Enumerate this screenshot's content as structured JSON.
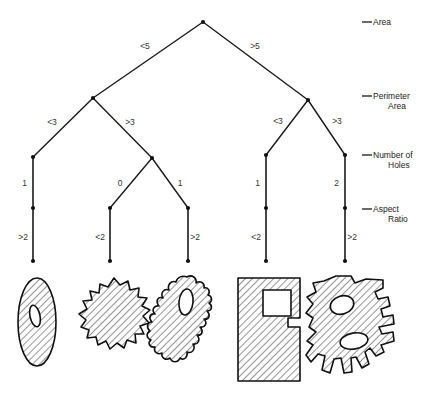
{
  "figure": {
    "type": "decision-tree-diagram",
    "background_color": "#ffffff",
    "line_color": "#111111",
    "text_color": "#333333"
  },
  "legend": {
    "items": [
      {
        "id": "area",
        "label": "Area",
        "label_lines": [
          "Area"
        ],
        "y": 22
      },
      {
        "id": "perimeter-area",
        "label": "Perimeter Area",
        "label_lines": [
          "Perimeter",
          "Area"
        ],
        "y": 96
      },
      {
        "id": "number-of-holes",
        "label": "Number of Holes",
        "label_lines": [
          "Number of",
          "Holes"
        ],
        "y": 155
      },
      {
        "id": "aspect-ratio",
        "label": "Aspect Ratio",
        "label_lines": [
          "Aspect",
          "Ratio"
        ],
        "y": 209
      }
    ]
  },
  "tree": {
    "levels": [
      "Area",
      "Perimeter Area",
      "Number of Holes",
      "Aspect Ratio"
    ],
    "nodes": [
      {
        "id": "root",
        "x": 203,
        "y": 22,
        "level": "Area"
      },
      {
        "id": "n-left",
        "x": 93,
        "y": 98,
        "level": "Perimeter Area"
      },
      {
        "id": "n-right",
        "x": 308,
        "y": 100,
        "level": "Perimeter Area"
      },
      {
        "id": "n-ll",
        "x": 33,
        "y": 157,
        "level": "Number of Holes"
      },
      {
        "id": "n-lr",
        "x": 152,
        "y": 158,
        "level": "Number of Holes"
      },
      {
        "id": "n-rl",
        "x": 266,
        "y": 155,
        "level": "Number of Holes"
      },
      {
        "id": "n-rr",
        "x": 345,
        "y": 155,
        "level": "Number of Holes"
      },
      {
        "id": "n-ll-a",
        "x": 33,
        "y": 208,
        "level": "Aspect Ratio"
      },
      {
        "id": "n-lr-a",
        "x": 110,
        "y": 208,
        "level": "Aspect Ratio"
      },
      {
        "id": "n-lr-b",
        "x": 188,
        "y": 208,
        "level": "Aspect Ratio"
      },
      {
        "id": "n-rl-a",
        "x": 266,
        "y": 208,
        "level": "Aspect Ratio"
      },
      {
        "id": "n-rr-a",
        "x": 345,
        "y": 208,
        "level": "Aspect Ratio"
      },
      {
        "id": "leaf-1",
        "x": 33,
        "y": 261,
        "level": "leaf"
      },
      {
        "id": "leaf-2",
        "x": 110,
        "y": 261,
        "level": "leaf"
      },
      {
        "id": "leaf-3",
        "x": 188,
        "y": 261,
        "level": "leaf"
      },
      {
        "id": "leaf-4",
        "x": 266,
        "y": 261,
        "level": "leaf"
      },
      {
        "id": "leaf-5",
        "x": 345,
        "y": 261,
        "level": "leaf"
      }
    ],
    "edges": [
      {
        "id": "e-root-left",
        "from": "root",
        "to": "n-left",
        "label": "<5",
        "label_x": 145,
        "label_y": 49,
        "anchor": "middle"
      },
      {
        "id": "e-root-right",
        "from": "root",
        "to": "n-right",
        "label": ">5",
        "label_x": 255,
        "label_y": 49,
        "anchor": "middle"
      },
      {
        "id": "e-left-ll",
        "from": "n-left",
        "to": "n-ll",
        "label": "<3",
        "label_x": 52,
        "label_y": 125,
        "anchor": "middle"
      },
      {
        "id": "e-left-lr",
        "from": "n-left",
        "to": "n-lr",
        "label": ">3",
        "label_x": 130,
        "label_y": 125,
        "anchor": "middle"
      },
      {
        "id": "e-right-rl",
        "from": "n-right",
        "to": "n-rl",
        "label": "<3",
        "label_x": 278,
        "label_y": 124,
        "anchor": "middle"
      },
      {
        "id": "e-right-rr",
        "from": "n-right",
        "to": "n-rr",
        "label": ">3",
        "label_x": 337,
        "label_y": 124,
        "anchor": "middle"
      },
      {
        "id": "e-ll-a",
        "from": "n-ll",
        "to": "n-ll-a",
        "label": "1",
        "label_x": 27,
        "label_y": 186,
        "anchor": "end"
      },
      {
        "id": "e-lr-a",
        "from": "n-lr",
        "to": "n-lr-a",
        "label": "0",
        "label_x": 120,
        "label_y": 186,
        "anchor": "middle"
      },
      {
        "id": "e-lr-b",
        "from": "n-lr",
        "to": "n-lr-b",
        "label": "1",
        "label_x": 180,
        "label_y": 186,
        "anchor": "middle"
      },
      {
        "id": "e-rl-a",
        "from": "n-rl",
        "to": "n-rl-a",
        "label": "1",
        "label_x": 260,
        "label_y": 186,
        "anchor": "end"
      },
      {
        "id": "e-rr-a",
        "from": "n-rr",
        "to": "n-rr-a",
        "label": "2",
        "label_x": 339,
        "label_y": 186,
        "anchor": "end"
      },
      {
        "id": "e-leaf-1",
        "from": "n-ll-a",
        "to": "leaf-1",
        "label": ">2",
        "label_x": 28,
        "label_y": 240,
        "anchor": "end"
      },
      {
        "id": "e-leaf-2",
        "from": "n-lr-a",
        "to": "leaf-2",
        "label": "<2",
        "label_x": 105,
        "label_y": 240,
        "anchor": "end"
      },
      {
        "id": "e-leaf-3",
        "from": "n-lr-b",
        "to": "leaf-3",
        "label": ">2",
        "label_x": 200,
        "label_y": 240,
        "anchor": "end"
      },
      {
        "id": "e-leaf-4",
        "from": "n-rl-a",
        "to": "leaf-4",
        "label": "<2",
        "label_x": 261,
        "label_y": 240,
        "anchor": "end"
      },
      {
        "id": "e-leaf-5",
        "from": "n-rr-a",
        "to": "leaf-5",
        "label": ">2",
        "label_x": 357,
        "label_y": 240,
        "anchor": "end"
      }
    ]
  },
  "shapes": [
    {
      "id": "shape-ellipse",
      "name": "hatched-ellipse-with-one-hole",
      "description": "Elongated vertical ellipse, hatched, with one small elliptical hole",
      "holes": 1,
      "under_leaf": "leaf-1",
      "center_x": 37,
      "center_y": 322
    },
    {
      "id": "shape-gear-blob",
      "name": "hatched-scalloped-blob-no-holes",
      "description": "Round scalloped/gear-like blob, hatched, no holes",
      "holes": 0,
      "under_leaf": "leaf-2",
      "center_x": 114,
      "center_y": 315
    },
    {
      "id": "shape-wiggly",
      "name": "hatched-wiggly-vertical-shape-one-hole",
      "description": "Tall wiggly serrated vertical shape, hatched, with one hole",
      "holes": 1,
      "under_leaf": "leaf-3",
      "center_x": 190,
      "center_y": 320
    },
    {
      "id": "shape-rect-notch",
      "name": "hatched-rectangle-with-square-hole",
      "description": "Large hatched rectangle with square hole and a notch in the right edge",
      "holes": 1,
      "under_leaf": "leaf-4",
      "center_x": 267,
      "center_y": 325
    },
    {
      "id": "shape-complex",
      "name": "hatched-irregular-blob-two-holes",
      "description": "Large irregular hatched blob with two elliptical holes",
      "holes": 2,
      "under_leaf": "leaf-5",
      "center_x": 350,
      "center_y": 325
    }
  ]
}
